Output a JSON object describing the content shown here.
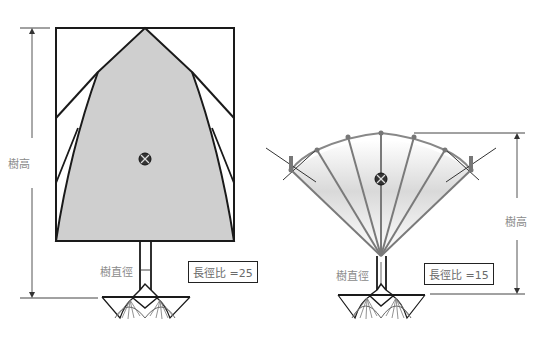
{
  "left_figure": {
    "height_label": "樹高",
    "diameter_label": "樹直徑",
    "ratio_label": "長徑比 =25"
  },
  "right_figure": {
    "height_label": "樹高",
    "diameter_label": "樹直徑",
    "ratio_label": "長徑比 =15"
  },
  "colors": {
    "crown_fill": "#cfcfcf",
    "outline": "#1a1a1a",
    "branch": "#7a7a7a",
    "label_text": "#8a8a8a"
  }
}
